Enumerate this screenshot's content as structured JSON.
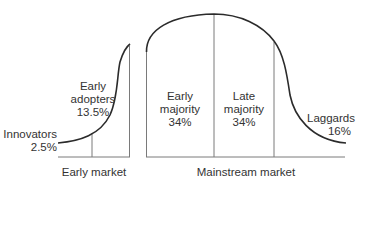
{
  "diagram": {
    "colors": {
      "curve": "#2b2b2b",
      "divider": "#7a7a7a",
      "text": "#333333"
    },
    "segments": [
      {
        "id": "innovators",
        "name": "Innovators",
        "percent": "2.5%"
      },
      {
        "id": "early_adopters",
        "name_line1": "Early",
        "name_line2": "adopters",
        "percent": "13.5%"
      },
      {
        "id": "early_majority",
        "name_line1": "Early",
        "name_line2": "majority",
        "percent": "34%"
      },
      {
        "id": "late_majority",
        "name_line1": "Late",
        "name_line2": "majority",
        "percent": "34%"
      },
      {
        "id": "laggards",
        "name": "Laggards",
        "percent": "16%"
      }
    ],
    "markets": [
      {
        "id": "early_market",
        "label": "Early market"
      },
      {
        "id": "mainstream_market",
        "label": "Mainstream market"
      }
    ]
  }
}
